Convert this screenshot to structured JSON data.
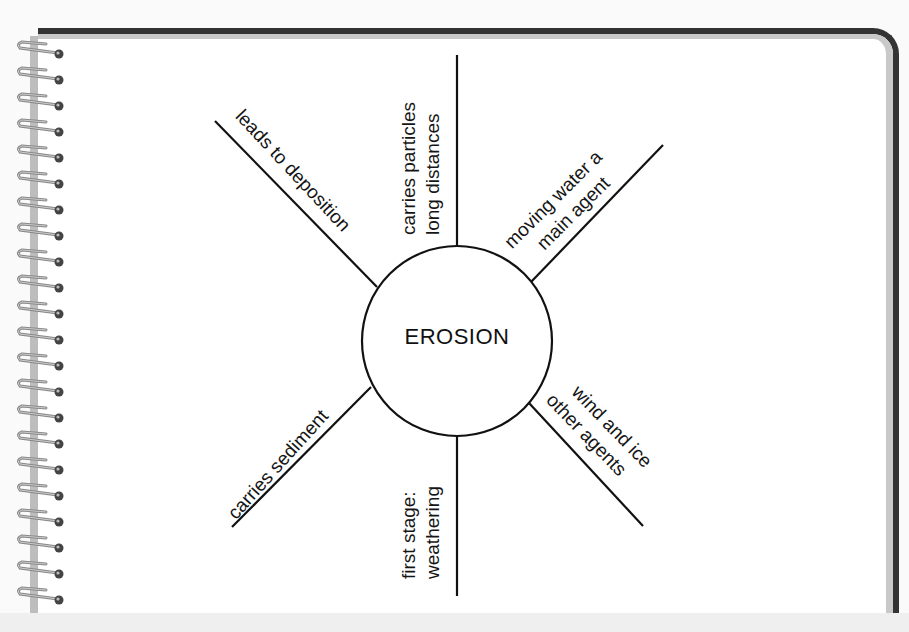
{
  "diagram": {
    "type": "concept-web",
    "center": {
      "label": "EROSION"
    },
    "spokes": [
      {
        "position": "top",
        "lines": [
          "carries particles",
          "long distances"
        ]
      },
      {
        "position": "upper-right",
        "lines": [
          "moving water a",
          "main agent"
        ]
      },
      {
        "position": "lower-right",
        "lines": [
          "wind and ice",
          "other agents"
        ]
      },
      {
        "position": "bottom",
        "lines": [
          "first stage:",
          "weathering"
        ]
      },
      {
        "position": "lower-left",
        "lines": [
          "carries sediment"
        ]
      },
      {
        "position": "upper-left",
        "lines": [
          "leads to deposition"
        ]
      }
    ]
  },
  "colors": {
    "ink": "#111111",
    "paper": "#ffffff",
    "border": "#333333",
    "background": "#efefef"
  }
}
